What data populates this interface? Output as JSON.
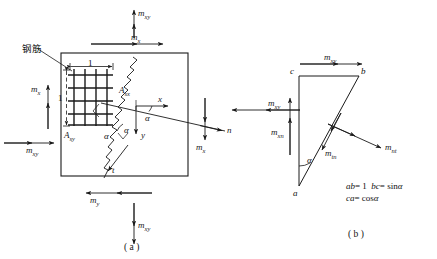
{
  "figure": {
    "title_a": "( a )",
    "title_b": "( b )",
    "annotation_rebar": "钢筋"
  },
  "panel_a": {
    "moments": {
      "top_outer": {
        "base": "m",
        "sub": "xy"
      },
      "top_inner": {
        "base": "m",
        "sub": "x"
      },
      "left_vertical": {
        "base": "m",
        "sub": "x"
      },
      "left_horizontal": {
        "base": "m",
        "sub": "xy"
      },
      "right_horizontal": {
        "base": "m",
        "sub": "xy"
      },
      "right_vertical": {
        "base": "m",
        "sub": "x"
      },
      "bottom_inner": {
        "base": "m",
        "sub": "y"
      },
      "bottom_outer": {
        "base": "m",
        "sub": "xy"
      }
    },
    "steel_areas": {
      "asx": {
        "base": "A",
        "sub": "sx"
      },
      "asy": {
        "base": "A",
        "sub": "sy"
      }
    },
    "dimensions": {
      "horizontal": "1",
      "vertical": "1"
    },
    "axes": {
      "x": "x",
      "y": "y",
      "n": "n",
      "t": "t"
    },
    "angles": {
      "alpha_1": "α",
      "alpha_2": "α",
      "alpha_3": "α"
    }
  },
  "panel_b": {
    "vertices": {
      "a": "a",
      "b": "b",
      "c": "c"
    },
    "moments": {
      "top": {
        "base": "m",
        "sub": "xy"
      },
      "left": {
        "base": "m",
        "sub": "xn"
      },
      "middle": {
        "base": "m",
        "sub": "tn"
      },
      "right": {
        "base": "m",
        "sub": "nt"
      }
    },
    "angle": "α",
    "formulas": {
      "line1_p1": "ab",
      "line1_eq1": "= 1",
      "line1_p2": "bc",
      "line1_eq2": "= sin",
      "line1_alpha": "α",
      "line2_p1": "ca",
      "line2_eq": "= cos",
      "line2_alpha": "α"
    }
  },
  "colors": {
    "stroke": "#1a1a1a",
    "background": "#ffffff"
  }
}
